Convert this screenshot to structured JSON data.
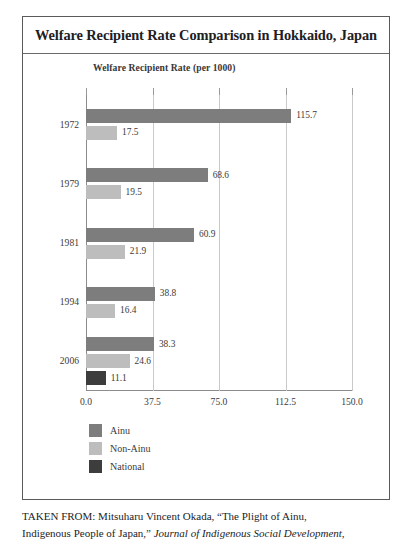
{
  "figure": {
    "title": "Welfare Recipient Rate Comparison in Hokkaido, Japan",
    "subtitle": "Welfare Recipient Rate (per 1000)"
  },
  "chart_data": {
    "type": "bar",
    "orientation": "horizontal",
    "title": "Welfare Recipient Rate Comparison in Hokkaido, Japan",
    "subtitle": "Welfare Recipient Rate (per 1000)",
    "xlabel": "",
    "ylabel": "",
    "xlim": [
      0.0,
      150.0
    ],
    "xticks": [
      "0.0",
      "37.5",
      "75.0",
      "112.5",
      "150.0"
    ],
    "xtick_values": [
      0.0,
      37.5,
      75.0,
      112.5,
      150.0
    ],
    "grid": "vertical",
    "legend_position": "below-left",
    "categories": [
      "1972",
      "1979",
      "1981",
      "1994",
      "2006"
    ],
    "series": [
      {
        "name": "Ainu",
        "color": "#7d7d7d",
        "values": [
          115.7,
          68.6,
          60.9,
          38.8,
          38.3
        ],
        "labels": [
          "115.7",
          "68.6",
          "60.9",
          "38.8",
          "38.3"
        ]
      },
      {
        "name": "Non-Ainu",
        "color": "#bdbdbd",
        "values": [
          17.5,
          19.5,
          21.9,
          16.4,
          24.6
        ],
        "labels": [
          "17.5",
          "19.5",
          "21.9",
          "16.4",
          "24.6"
        ]
      },
      {
        "name": "National",
        "color": "#3d3d3d",
        "values": [
          null,
          null,
          null,
          null,
          11.1
        ],
        "labels": [
          "",
          "",
          "",
          "",
          "11.1"
        ]
      }
    ]
  },
  "legend": [
    {
      "label": "Ainu",
      "color": "#7d7d7d"
    },
    {
      "label": "Non-Ainu",
      "color": "#bdbdbd"
    },
    {
      "label": "National",
      "color": "#3d3d3d"
    }
  ],
  "caption": {
    "line1_prefix": "TAKEN FROM: Mitsuharu Vincent Okada, “The Plight of Ainu,",
    "line2_prefix": "Indigenous People of Japan,” ",
    "line2_italic": "Journal of Indigenous Social Development,"
  }
}
